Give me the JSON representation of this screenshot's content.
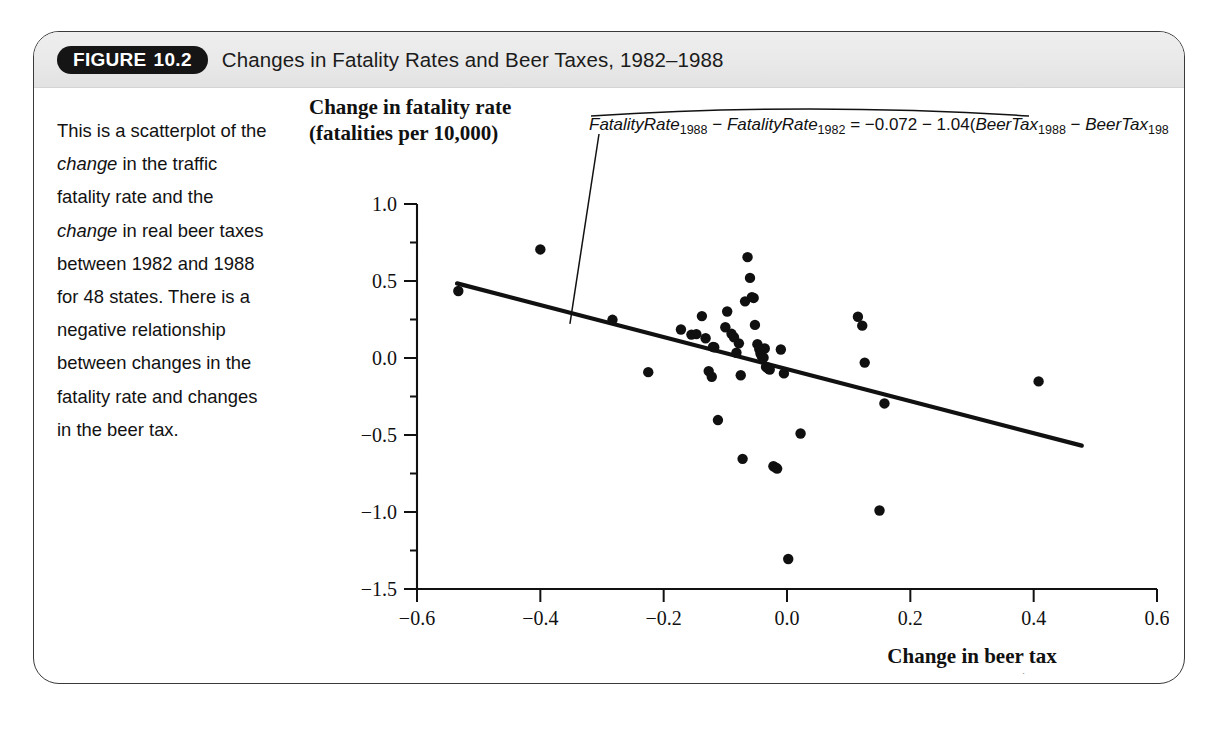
{
  "figure": {
    "badge_word": "FIGURE",
    "badge_number": "10.2",
    "title": "Changes in Fatality Rates and Beer Taxes, 1982–1988",
    "caption_part1": "This is a scatterplot of the ",
    "caption_em1": "change",
    "caption_part2": " in the traffic fatality rate and the ",
    "caption_em2": "change",
    "caption_part3": " in real beer taxes between 1982 and 1988 for 48 states. There is a negative relationship between changes in the fatality rate and changes in the beer tax."
  },
  "colors": {
    "header_bg": "#e9e9e9",
    "badge_bg": "#151515",
    "frame_border": "#3a3a3a",
    "ink": "#111111"
  },
  "annotation": {
    "equation_plain": "FatalityRate1988 − FatalityRate1982 = −0.072 − 1.04(BeerTax1988 − BeerTax1982)",
    "seg_fr": "FatalityRate",
    "sub_1988": "1988",
    "minus": "−",
    "sub_1982": "1982",
    "eq_sign": "=",
    "intercept": "−0.072",
    "slope_op": "−",
    "slope": "1.04(",
    "seg_bt": "BeerTax",
    "close_paren": ")"
  },
  "chart_data": {
    "type": "scatter",
    "title": "Changes in Fatality Rates and Beer Taxes, 1982–1988",
    "xlabel": "Change in beer tax",
    "xlabel_sub": "(dollars per case $1988)",
    "ylabel": "Change in fatality rate",
    "ylabel_sub": "(fatalities per 10,000)",
    "xlim": [
      -0.6,
      0.6
    ],
    "ylim": [
      -1.5,
      1.0
    ],
    "xticks": [
      -0.6,
      -0.4,
      -0.2,
      0.0,
      0.2,
      0.4,
      0.6
    ],
    "xticklabels": [
      "−0.6",
      "−0.4",
      "−0.2",
      "0.0",
      "0.2",
      "0.4",
      "0.6"
    ],
    "yticks": [
      1.0,
      0.5,
      0.0,
      -0.5,
      -1.0,
      -1.5
    ],
    "yticklabels": [
      "1.0",
      "0.5",
      "0.0",
      "−0.5",
      "−1.0",
      "−1.5"
    ],
    "grid": false,
    "legend": "none",
    "n_points": 48,
    "regression": {
      "intercept": -0.072,
      "slope": -1.04,
      "x_start": -0.535,
      "x_end": 0.478,
      "label": "FatalityRate1988 − FatalityRate1982 = −0.072 − 1.04(BeerTax1988 − BeerTax1982)"
    },
    "points": [
      [
        -0.533,
        0.435
      ],
      [
        -0.4,
        0.705
      ],
      [
        -0.283,
        0.248
      ],
      [
        -0.225,
        -0.092
      ],
      [
        -0.172,
        0.185
      ],
      [
        -0.155,
        0.152
      ],
      [
        -0.147,
        0.155
      ],
      [
        -0.138,
        0.272
      ],
      [
        -0.132,
        0.128
      ],
      [
        -0.127,
        -0.085
      ],
      [
        -0.122,
        -0.122
      ],
      [
        -0.12,
        0.072
      ],
      [
        -0.118,
        0.07
      ],
      [
        -0.112,
        -0.403
      ],
      [
        -0.1,
        0.2
      ],
      [
        -0.097,
        0.302
      ],
      [
        -0.09,
        0.157
      ],
      [
        -0.086,
        0.135
      ],
      [
        -0.082,
        0.034
      ],
      [
        -0.078,
        0.095
      ],
      [
        -0.075,
        -0.112
      ],
      [
        -0.072,
        -0.655
      ],
      [
        -0.068,
        0.368
      ],
      [
        -0.064,
        0.655
      ],
      [
        -0.06,
        0.52
      ],
      [
        -0.057,
        0.395
      ],
      [
        -0.054,
        0.39
      ],
      [
        -0.052,
        0.215
      ],
      [
        -0.048,
        0.09
      ],
      [
        -0.045,
        0.058
      ],
      [
        -0.043,
        0.03
      ],
      [
        -0.041,
        0.012
      ],
      [
        -0.038,
        0.002
      ],
      [
        -0.036,
        0.062
      ],
      [
        -0.034,
        -0.058
      ],
      [
        -0.032,
        -0.062
      ],
      [
        -0.03,
        -0.07
      ],
      [
        -0.028,
        -0.075
      ],
      [
        -0.022,
        -0.703
      ],
      [
        -0.018,
        -0.712
      ],
      [
        -0.016,
        -0.718
      ],
      [
        -0.01,
        0.055
      ],
      [
        -0.005,
        -0.1
      ],
      [
        0.002,
        -1.305
      ],
      [
        0.022,
        -0.49
      ],
      [
        0.115,
        0.268
      ],
      [
        0.122,
        0.21
      ],
      [
        0.126,
        -0.03
      ],
      [
        0.15,
        -0.99
      ],
      [
        0.158,
        -0.295
      ],
      [
        0.408,
        -0.152
      ]
    ]
  }
}
